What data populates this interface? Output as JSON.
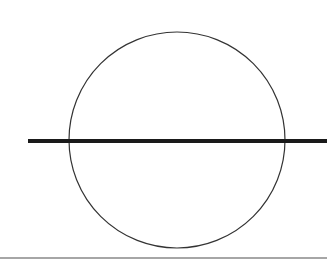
{
  "diagram": {
    "circle": {
      "cx": 177,
      "cy": 140,
      "r": 108,
      "stroke": "#333333",
      "stroke_width": 1.2
    },
    "line": {
      "x1": 28,
      "y1": 141,
      "x2": 327,
      "y2": 141,
      "stroke": "#1a1a1a",
      "stroke_width": 4
    },
    "bottom_border": {
      "y": 258,
      "stroke": "#888888"
    }
  }
}
